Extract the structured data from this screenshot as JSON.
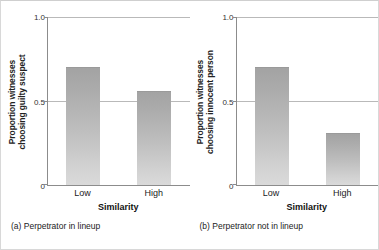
{
  "figure": {
    "background_color": "#ffffff",
    "border_color": "#d8d8d8",
    "bar_color_top": "#a3a3a3",
    "bar_color_bottom": "#dadada",
    "gridline_color": "#b9b9b9",
    "axis_color": "#8c8c8c"
  },
  "chart_data": [
    {
      "type": "bar",
      "panel": "a",
      "title": "",
      "caption": "(a) Perpetrator in lineup",
      "categories": [
        "Low",
        "High"
      ],
      "values": [
        0.7,
        0.56
      ],
      "xlabel": "Similarity",
      "ylabel": "Proportion witnesses choosing guilty suspect",
      "ylabel_line1": "Proportion witnesses",
      "ylabel_line2": "choosing guilty suspect",
      "ylim": [
        0,
        1.0
      ],
      "yticks": [
        0,
        0.5,
        1.0
      ],
      "ytick_labels": [
        "0",
        "0.5",
        "1.0"
      ],
      "grid": true,
      "gridlines_at": [
        0.5,
        1.0
      ],
      "legend": "none"
    },
    {
      "type": "bar",
      "panel": "b",
      "title": "",
      "caption": "(b) Perpetrator not in lineup",
      "categories": [
        "Low",
        "High"
      ],
      "values": [
        0.7,
        0.31
      ],
      "xlabel": "Similarity",
      "ylabel": "Proportion witnesses choosing innocent person",
      "ylabel_line1": "Proportion witnesses",
      "ylabel_line2": "choosing innocent person",
      "ylim": [
        0,
        1.0
      ],
      "yticks": [
        0,
        0.5,
        1.0
      ],
      "ytick_labels": [
        "0",
        "0.5",
        "1.0"
      ],
      "grid": true,
      "gridlines_at": [
        0.5,
        1.0
      ],
      "legend": "none"
    }
  ]
}
